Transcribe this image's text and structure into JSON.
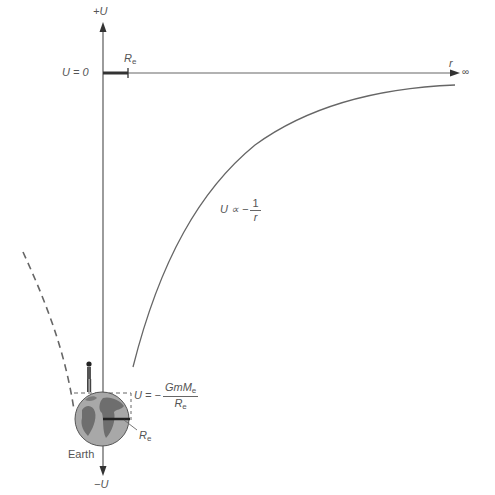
{
  "diagram": {
    "type": "gravitational-potential-energy-graph",
    "axes": {
      "y_pos_label": "+U",
      "y_neg_label": "−U",
      "x_label": "r",
      "x_end_label": "∞",
      "zero_label": "U = 0"
    },
    "labels": {
      "re_top": "R",
      "re_top_sub": "e",
      "curve_label_prefix": "U ∝ −",
      "curve_label_num": "1",
      "curve_label_den": "r",
      "surface_prefix": "U = −",
      "surface_num": "GmM",
      "surface_num_sub": "e",
      "surface_den": "R",
      "surface_den_sub": "e",
      "re_earth": "R",
      "re_earth_sub": "e",
      "earth": "Earth"
    },
    "colors": {
      "line": "#666666",
      "text": "#555555",
      "globe": "#9a9a9a",
      "land": "#6e6e6e"
    }
  }
}
